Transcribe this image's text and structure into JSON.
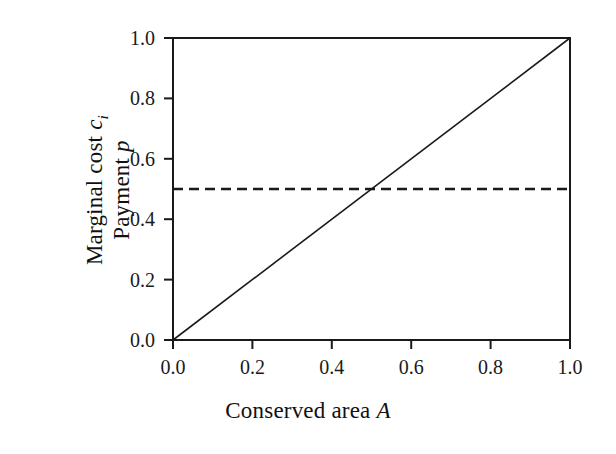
{
  "chart_data": {
    "type": "line",
    "title": "",
    "subtitle": "",
    "xlabel": "Conserved area A",
    "xlabel_text": "Conserved area ",
    "xlabel_var": "A",
    "ylabel_line1_text": "Marginal cost ",
    "ylabel_line1_var": "c",
    "ylabel_line1_sub": "i",
    "ylabel_line2_text": "Payment ",
    "ylabel_line2_var": "p",
    "xlim": [
      0.0,
      1.0
    ],
    "ylim": [
      0.0,
      1.0
    ],
    "xticks": [
      "0.0",
      "0.2",
      "0.4",
      "0.6",
      "0.8",
      "1.0"
    ],
    "xtick_values": [
      0.0,
      0.2,
      0.4,
      0.6,
      0.8,
      1.0
    ],
    "yticks": [
      "0.0",
      "0.2",
      "0.4",
      "0.6",
      "0.8",
      "1.0"
    ],
    "ytick_values": [
      0.0,
      0.2,
      0.4,
      0.6,
      0.8,
      1.0
    ],
    "grid": false,
    "legend": "none",
    "frame": "box",
    "tick_direction": "out",
    "line_color": "#1a1a1a",
    "background_color": "#ffffff",
    "series": [
      {
        "name": "Marginal cost c_i",
        "style": "solid",
        "color": "#1a1a1a",
        "linewidth": 1.6,
        "x": [
          0.0,
          1.0
        ],
        "values": [
          0.0,
          1.0
        ],
        "description": "Marginal cost increases linearly with conserved area, c_i = A"
      },
      {
        "name": "Payment p",
        "style": "dashed",
        "color": "#1a1a1a",
        "linewidth": 2.6,
        "dash_pattern": "10 6",
        "x": [
          0.0,
          1.0
        ],
        "values": [
          0.5,
          0.5
        ],
        "description": "Constant payment p = 0.5 across all conserved area"
      }
    ],
    "intersection": {
      "x": 0.5,
      "y": 0.5
    }
  }
}
